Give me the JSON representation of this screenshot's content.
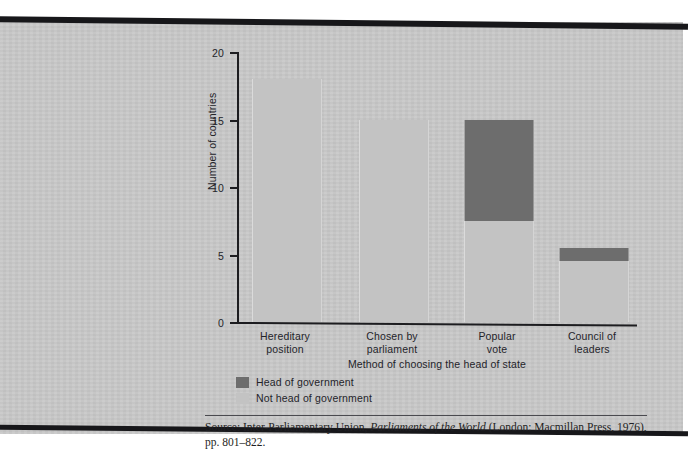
{
  "figure": {
    "background_color": "#c8c8c8",
    "rule_color": "#17171a"
  },
  "chart_data": {
    "type": "bar",
    "subtype": "stacked-bar",
    "title": "",
    "subtitle": "",
    "xlabel": "Method of choosing the head of state",
    "ylabel": "Number of countries",
    "categories": [
      "Hereditary position",
      "Chosen by parliament",
      "Popular vote",
      "Council of leaders"
    ],
    "category_lines": [
      [
        "Hereditary",
        "position"
      ],
      [
        "Chosen by",
        "parliament"
      ],
      [
        "Popular",
        "vote"
      ],
      [
        "Council of",
        "leaders"
      ]
    ],
    "series": [
      {
        "name": "Not head of government",
        "color": "#c3c3c3",
        "values": [
          18,
          15,
          7.5,
          4.5
        ]
      },
      {
        "name": "Head of government",
        "color": "#6d6d6d",
        "values": [
          0,
          0,
          7.5,
          1
        ]
      }
    ],
    "totals": [
      18,
      15,
      15,
      5.5
    ],
    "ylim": [
      0,
      20
    ],
    "yticks": [
      0,
      5,
      10,
      15,
      20
    ],
    "ytick_labels": [
      "0",
      "5",
      "10",
      "15",
      "20"
    ],
    "grid": false,
    "legend_position": "below-axis-left",
    "legend": [
      {
        "label": "Head of government",
        "color": "#6d6d6d"
      },
      {
        "label": "Not head of government",
        "color": "#c3c3c3"
      }
    ]
  },
  "source_note": {
    "prefix": "Source: Inter-Parliamentary Union, ",
    "italic_title": "Parliaments of the World",
    "suffix": " (London: Macmillan Press, 1976), pp. 801–822."
  }
}
